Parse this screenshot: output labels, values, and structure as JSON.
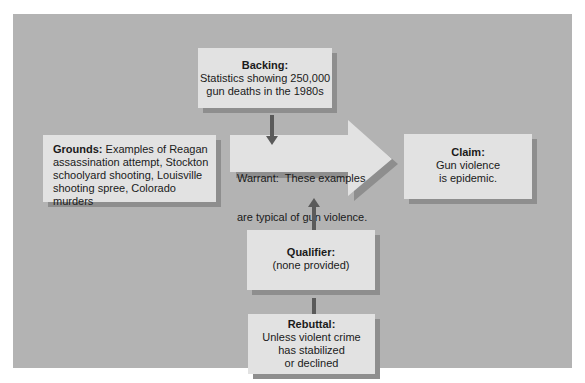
{
  "diagram": {
    "type": "Toulmin argument model",
    "background_color": "#b3b3b3",
    "box_color": "#e2e2e2",
    "shadow_color": "#8e8e8e",
    "arrow_color": "#5a5a5a",
    "backing": {
      "label": "Backing:",
      "lines": [
        "Statistics showing 250,000",
        "gun deaths in the 1980s"
      ]
    },
    "grounds": {
      "label": "Grounds:",
      "lines": [
        " Examples of Reagan",
        "assassination attempt, Stockton",
        "schoolyard shooting, Louisville",
        "shooting spree, Colorado murders"
      ]
    },
    "warrant": {
      "label": "Warrant:",
      "lines": [
        "  These examples",
        "are typical of gun violence."
      ]
    },
    "claim": {
      "label": "Claim:",
      "lines": [
        "Gun violence",
        "is epidemic."
      ]
    },
    "qualifier": {
      "label": "Qualifier:",
      "lines": [
        "(none provided)"
      ]
    },
    "rebuttal": {
      "label": "Rebuttal:",
      "lines": [
        "Unless violent crime",
        "has stabilized",
        "or declined"
      ]
    },
    "edges": [
      {
        "from": "backing",
        "to": "warrant",
        "direction": "down"
      },
      {
        "from": "qualifier",
        "to": "warrant",
        "direction": "up"
      },
      {
        "from": "rebuttal",
        "to": "qualifier",
        "direction": "connector"
      },
      {
        "from": "warrant",
        "to": "claim",
        "direction": "right"
      }
    ]
  }
}
